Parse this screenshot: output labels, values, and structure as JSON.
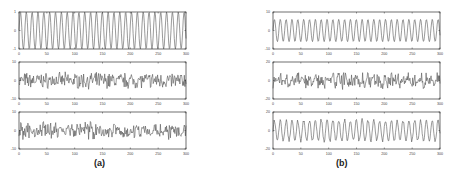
{
  "figure": {
    "captions": {
      "a": "(a)",
      "b": "(b)"
    },
    "line_color": "#555555",
    "axis_color": "#333333"
  },
  "chart_data": [
    {
      "id": "a1",
      "group": "a",
      "type": "line",
      "title": "",
      "xlabel": "",
      "ylabel": "",
      "xlim": [
        0,
        300
      ],
      "ylim": [
        -1,
        1
      ],
      "xticks": [
        0,
        50,
        100,
        150,
        200,
        250,
        300
      ],
      "yticks": [
        -1,
        0,
        1
      ],
      "grid": false,
      "series": [
        {
          "name": "sinusoid",
          "kind": "sine",
          "amplitude": 1,
          "period": 10.5,
          "noise": 0
        }
      ]
    },
    {
      "id": "a2",
      "group": "a",
      "type": "line",
      "title": "",
      "xlabel": "",
      "ylabel": "",
      "xlim": [
        0,
        300
      ],
      "ylim": [
        -10,
        10
      ],
      "xticks": [
        0,
        50,
        100,
        150,
        200,
        250,
        300
      ],
      "yticks": [
        -10,
        0,
        10
      ],
      "grid": false,
      "series": [
        {
          "name": "noisy",
          "kind": "noise",
          "amplitude": 0,
          "period": 10.5,
          "noise": 3.2,
          "seed": 7
        }
      ]
    },
    {
      "id": "a3",
      "group": "a",
      "type": "line",
      "title": "",
      "xlabel": "",
      "ylabel": "",
      "xlim": [
        0,
        300
      ],
      "ylim": [
        -10,
        10
      ],
      "xticks": [
        0,
        50,
        100,
        150,
        200,
        250,
        300
      ],
      "yticks": [
        -10,
        0,
        10
      ],
      "grid": false,
      "series": [
        {
          "name": "noisy",
          "kind": "noise",
          "amplitude": 0.8,
          "period": 10.5,
          "noise": 3.0,
          "seed": 19
        }
      ]
    },
    {
      "id": "b1",
      "group": "b",
      "type": "line",
      "title": "",
      "xlabel": "",
      "ylabel": "",
      "xlim": [
        0,
        300
      ],
      "ylim": [
        -10,
        10
      ],
      "xticks": [
        0,
        50,
        100,
        150,
        200,
        250,
        300
      ],
      "yticks": [
        -10,
        0,
        10
      ],
      "grid": false,
      "series": [
        {
          "name": "sinusoid",
          "kind": "sine",
          "amplitude": 6,
          "period": 10.5,
          "noise": 0
        }
      ]
    },
    {
      "id": "b2",
      "group": "b",
      "type": "line",
      "title": "",
      "xlabel": "",
      "ylabel": "",
      "xlim": [
        0,
        300
      ],
      "ylim": [
        -20,
        20
      ],
      "xticks": [
        0,
        50,
        100,
        150,
        200,
        250,
        300
      ],
      "yticks": [
        -20,
        0,
        20
      ],
      "grid": false,
      "series": [
        {
          "name": "noisy",
          "kind": "noise",
          "amplitude": 2,
          "period": 10.5,
          "noise": 6.0,
          "seed": 31
        }
      ]
    },
    {
      "id": "b3",
      "group": "b",
      "type": "line",
      "title": "",
      "xlabel": "",
      "ylabel": "",
      "xlim": [
        0,
        300
      ],
      "ylim": [
        -20,
        20
      ],
      "xticks": [
        0,
        50,
        100,
        150,
        200,
        250,
        300
      ],
      "yticks": [
        -20,
        0,
        20
      ],
      "grid": false,
      "series": [
        {
          "name": "recovered",
          "kind": "sine",
          "amplitude": 11,
          "period": 10.5,
          "noise": 1.5,
          "seed": 43
        }
      ]
    }
  ]
}
